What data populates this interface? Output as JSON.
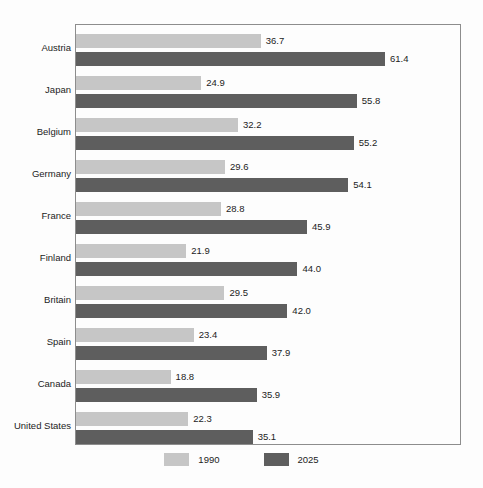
{
  "chart_data": {
    "type": "bar",
    "orientation": "horizontal",
    "title": "",
    "subtitle": "",
    "xlabel": "",
    "ylabel": "",
    "grid": false,
    "legend_position": "bottom-center",
    "xlim": [
      0,
      61.4
    ],
    "categories": [
      "Austria",
      "Japan",
      "Belgium",
      "Germany",
      "France",
      "Finland",
      "Britain",
      "Spain",
      "Canada",
      "United States"
    ],
    "series": [
      {
        "name": "1990",
        "color": "#c6c6c6",
        "values": [
          36.7,
          24.9,
          32.2,
          29.6,
          28.8,
          21.9,
          29.5,
          23.4,
          18.8,
          22.3
        ],
        "labels": [
          "36.7",
          "24.9",
          "32.2",
          "29.6",
          "28.8",
          "21.9",
          "29.5",
          "23.4",
          "18.8",
          "22.3"
        ]
      },
      {
        "name": "2025",
        "color": "#5e5e5e",
        "values": [
          61.4,
          55.8,
          55.2,
          54.1,
          45.9,
          44.0,
          42.0,
          37.9,
          35.9,
          35.1
        ],
        "labels": [
          "61.4",
          "55.8",
          "55.2",
          "54.1",
          "45.9",
          "44.0",
          "42.0",
          "37.9",
          "35.9",
          "35.1"
        ]
      }
    ]
  },
  "legend": {
    "items": [
      {
        "label": "1990",
        "color": "#c6c6c6"
      },
      {
        "label": "2025",
        "color": "#5e5e5e"
      }
    ]
  },
  "style": {
    "background": "#fdfdfd",
    "frame_border": "#8d8d8d",
    "text": "#1c1c1c"
  }
}
